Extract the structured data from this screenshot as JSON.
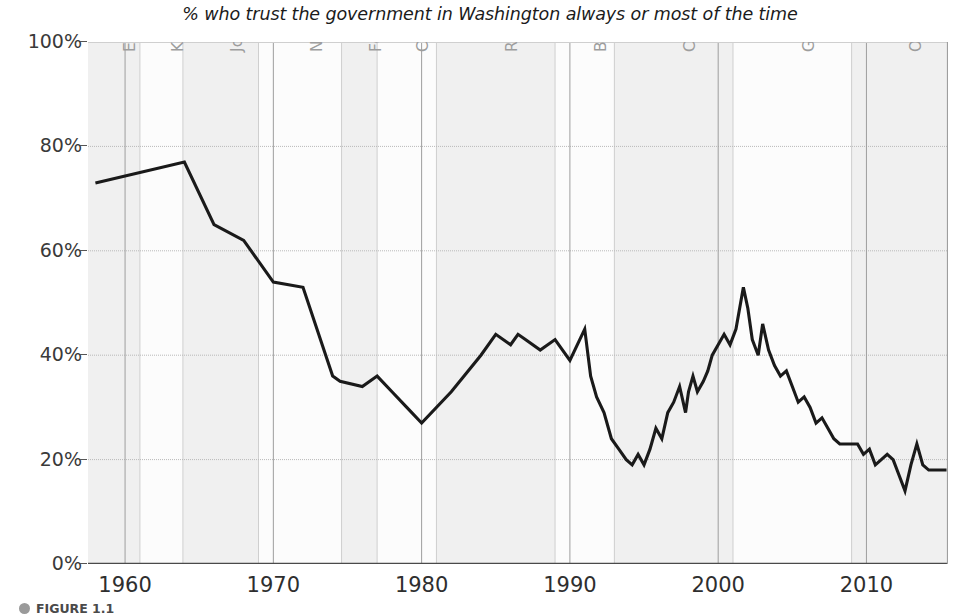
{
  "figure": {
    "title": "% who trust the government in Washington always or most of the time",
    "caption_label": "FIGURE 1.1",
    "caption_bullet_icon": "bullet-dot-icon",
    "line_color": "#1a1a1a",
    "band_color_shaded": "#f0f0f0",
    "band_color_plain": "#fcfcfc",
    "grid_color": "#b9b9b9",
    "axis_color": "#4a4a4a",
    "pres_label_color": "#9d9d9d"
  },
  "chart_data": {
    "type": "line",
    "title": "% who trust the government in Washington always or most of the time",
    "xlabel": "",
    "ylabel": "",
    "xlim": [
      1957.5,
      2015.5
    ],
    "ylim": [
      0,
      100
    ],
    "grid": true,
    "legend_position": "none",
    "ytick_labels": [
      "100%",
      "80%",
      "60%",
      "40%",
      "20%",
      "0%"
    ],
    "ytick_values": [
      100,
      80,
      60,
      40,
      20,
      0
    ],
    "xtick_labels": [
      "1960",
      "1970",
      "1980",
      "1990",
      "2000",
      "2010"
    ],
    "xtick_values": [
      1960,
      1970,
      1980,
      1990,
      2000,
      2010
    ],
    "series": [
      {
        "name": "Trust in federal government",
        "x": [
          1958,
          1964,
          1966,
          1968,
          1970,
          1972,
          1974,
          1974.5,
          1976,
          1977,
          1978,
          1979,
          1980,
          1982,
          1984,
          1985,
          1986,
          1986.5,
          1987,
          1988,
          1989,
          1990,
          1991,
          1991.4,
          1991.8,
          1992.3,
          1992.8,
          1993.3,
          1993.8,
          1994.2,
          1994.6,
          1995,
          1995.4,
          1995.8,
          1996.2,
          1996.6,
          1997,
          1997.4,
          1997.8,
          1998,
          1998.3,
          1998.6,
          1999,
          1999.3,
          1999.6,
          2000,
          2000.4,
          2000.8,
          2001.2,
          2001.7,
          2002,
          2002.3,
          2002.7,
          2003,
          2003.4,
          2003.8,
          2004.2,
          2004.6,
          2005,
          2005.4,
          2005.8,
          2006.2,
          2006.6,
          2007,
          2007.4,
          2007.8,
          2008.2,
          2008.6,
          2009,
          2009.4,
          2009.8,
          2010.2,
          2010.6,
          2011,
          2011.4,
          2011.8,
          2012.2,
          2012.6,
          2013,
          2013.4,
          2013.8,
          2014.2,
          2014.6,
          2015,
          2015.4
        ],
        "y": [
          73,
          77,
          65,
          62,
          54,
          53,
          36,
          35,
          34,
          36,
          33,
          30,
          27,
          33,
          40,
          44,
          42,
          44,
          43,
          41,
          43,
          39,
          45,
          36,
          32,
          29,
          24,
          22,
          20,
          19,
          21,
          19,
          22,
          26,
          24,
          29,
          31,
          34,
          29,
          33,
          36,
          33,
          35,
          37,
          40,
          42,
          44,
          42,
          45,
          53,
          49,
          43,
          40,
          46,
          41,
          38,
          36,
          37,
          34,
          31,
          32,
          30,
          27,
          28,
          26,
          24,
          23,
          23,
          23,
          23,
          21,
          22,
          19,
          20,
          21,
          20,
          17,
          14,
          19,
          23,
          19,
          18,
          18,
          18,
          18
        ]
      }
    ],
    "annotation_bands": [
      {
        "label": "Eisenhower",
        "start": 1957.5,
        "end": 1961.0,
        "shaded": true
      },
      {
        "label": "Kennedy",
        "start": 1961.0,
        "end": 1963.9,
        "shaded": false
      },
      {
        "label": "Johnson",
        "start": 1963.9,
        "end": 1969.0,
        "shaded": true
      },
      {
        "label": "Nixon",
        "start": 1969.0,
        "end": 1974.6,
        "shaded": false
      },
      {
        "label": "Ford",
        "start": 1974.6,
        "end": 1977.0,
        "shaded": true
      },
      {
        "label": "Carter",
        "start": 1977.0,
        "end": 1981.0,
        "shaded": false
      },
      {
        "label": "Reagan",
        "start": 1981.0,
        "end": 1989.0,
        "shaded": true
      },
      {
        "label": "Bush",
        "start": 1989.0,
        "end": 1993.0,
        "shaded": false
      },
      {
        "label": "Clinton",
        "start": 1993.0,
        "end": 2001.0,
        "shaded": true
      },
      {
        "label": "G. W. Bush",
        "start": 2001.0,
        "end": 2009.0,
        "shaded": false
      },
      {
        "label": "Obama",
        "start": 2009.0,
        "end": 2015.5,
        "shaded": true
      }
    ]
  }
}
